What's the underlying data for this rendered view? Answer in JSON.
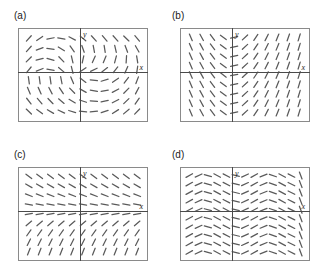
{
  "figure": {
    "panels": [
      {
        "id": "a",
        "label": "(a)",
        "label_x": 14,
        "label_y": 10,
        "frame": {
          "x": 18,
          "y": 28,
          "w": 130,
          "h": 94
        },
        "origin_fx": 0.478,
        "origin_fy": 0.468,
        "x_axis_label": "x",
        "y_axis_label": "y",
        "field": "spiral",
        "cols": 11,
        "rows": 8,
        "tick_len": 7.2
      },
      {
        "id": "b",
        "label": "(b)",
        "label_x": 172,
        "label_y": 10,
        "frame": {
          "x": 180,
          "y": 28,
          "w": 130,
          "h": 94
        },
        "origin_fx": 0.4,
        "origin_fy": 0.468,
        "x_axis_label": "x",
        "y_axis_label": "y",
        "field": "x-only",
        "cols": 11,
        "rows": 9,
        "tick_len": 7.2
      },
      {
        "id": "c",
        "label": "(c)",
        "label_x": 14,
        "label_y": 149,
        "frame": {
          "x": 18,
          "y": 167,
          "w": 130,
          "h": 94
        },
        "origin_fx": 0.478,
        "origin_fy": 0.468,
        "x_axis_label": "x",
        "y_axis_label": "y",
        "field": "y-only",
        "cols": 11,
        "rows": 9,
        "tick_len": 7.2
      },
      {
        "id": "d",
        "label": "(d)",
        "label_x": 172,
        "label_y": 149,
        "frame": {
          "x": 180,
          "y": 167,
          "w": 130,
          "h": 94
        },
        "origin_fx": 0.4,
        "origin_fy": 0.468,
        "x_axis_label": "x",
        "y_axis_label": "y",
        "field": "chevron",
        "cols": 13,
        "rows": 10,
        "tick_len": 7.4
      }
    ]
  },
  "chart_data": {
    "type": "scatter",
    "title": "",
    "xlabel": "x",
    "ylabel": "y",
    "panels": [
      {
        "id": "a",
        "label": "(a)",
        "slope_depends_on": [
          "x",
          "y"
        ],
        "xlim": [
          -4.4,
          4.8
        ],
        "ylim": [
          -3.3,
          3.0
        ],
        "grid": false,
        "axes": [
          "x",
          "y"
        ],
        "pattern": "Slopes rotate around the origin. Upper-left and lower-right quadrants hold uniform steep negative and steep positive segments respectively, while the upper-right quadrant sweeps from negative through horizontal to positive, giving a spiral / saddle-like circulation."
      },
      {
        "id": "b",
        "label": "(b)",
        "slope_depends_on": [
          "x"
        ],
        "xlim": [
          -3.6,
          5.4
        ],
        "ylim": [
          -3.3,
          3.0
        ],
        "grid": false,
        "axes": [
          "x",
          "y"
        ],
        "pattern": "Slope is a function of x alone: every column of segments is identical. Segments are flat (horizontal) on the y-axis and tilt increasingly steeply, negative to the left and positive to the right, producing vertical chevron columns."
      },
      {
        "id": "c",
        "label": "(c)",
        "slope_depends_on": [
          "y"
        ],
        "xlim": [
          -4.4,
          4.8
        ],
        "ylim": [
          -3.3,
          3.0
        ],
        "grid": false,
        "axes": [
          "x",
          "y"
        ],
        "pattern": "Slope is a function of y alone: every row of segments is identical. Segments are shallow negative near the top of the frame, flatten to horizontal just above the x-axis, and become steeply positive toward the bottom."
      },
      {
        "id": "d",
        "label": "(d)",
        "slope_depends_on": [
          "x"
        ],
        "xlim": [
          -3.6,
          5.4
        ],
        "ylim": [
          -3.3,
          3.0
        ],
        "grid": false,
        "axes": [
          "x",
          "y"
        ],
        "pattern": "Shallow segments forming repeating chevrons that are periodic in x. Slopes alternate between mildly positive and mildly negative as x increases, with near-vertical kinks where the sign flips, and the pattern repeats unchanged for every value of y."
      }
    ]
  }
}
